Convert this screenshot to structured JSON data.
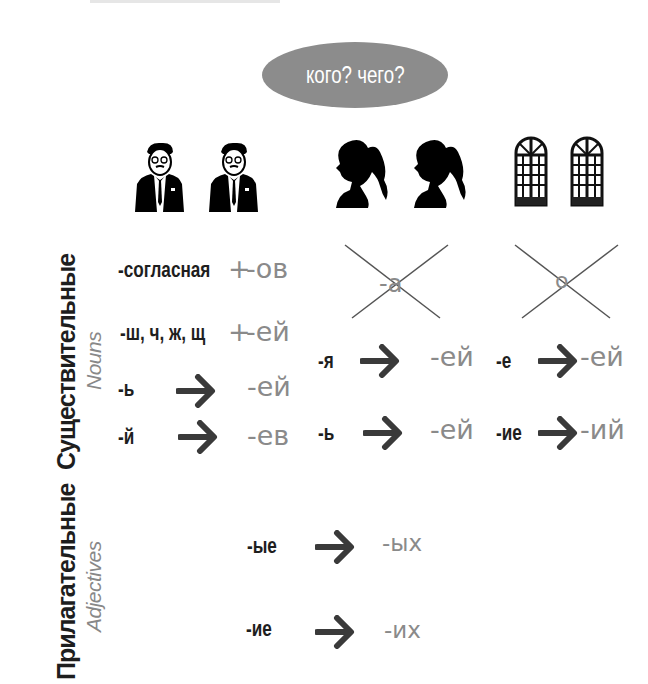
{
  "question_bubble": {
    "text": "кого? чего?",
    "color": "#8c8c8c"
  },
  "columns": [
    {
      "name": "masculine",
      "icon": "businessman-icon"
    },
    {
      "name": "feminine",
      "icon": "woman-silhouette-icon"
    },
    {
      "name": "neuter",
      "icon": "arched-window-icon"
    }
  ],
  "sections": {
    "nouns": {
      "label": "Существительные",
      "sublabel": "Nouns"
    },
    "adjectives": {
      "label": "Прилагательные",
      "sublabel": "Adjectives"
    }
  },
  "nouns": {
    "masculine": [
      {
        "from": "-согласная",
        "op": "+",
        "to": "-ов"
      },
      {
        "from": "-ш, ч, ж, щ",
        "op": "+",
        "to": "-ей"
      },
      {
        "from": "-ь",
        "op": "arrow",
        "to": "-ей"
      },
      {
        "from": "-й",
        "op": "arrow",
        "to": "-ев"
      }
    ],
    "feminine": {
      "crossed_out": "-а",
      "rules": [
        {
          "from": "-я",
          "op": "arrow",
          "to": "-ей"
        },
        {
          "from": "-ь",
          "op": "arrow",
          "to": "-ей"
        }
      ]
    },
    "neuter": {
      "crossed_out": "о",
      "rules": [
        {
          "from": "-е",
          "op": "arrow",
          "to": "-ей"
        },
        {
          "from": "-ие",
          "op": "arrow",
          "to": "-ий"
        }
      ]
    }
  },
  "adjectives": [
    {
      "from": "-ые",
      "op": "arrow",
      "to": "-ых"
    },
    {
      "from": "-ие",
      "op": "arrow",
      "to": "-их"
    }
  ],
  "colors": {
    "dark_text": "#1e1e1e",
    "ending_text": "#8a8a8a",
    "arrow": "#3a3a3a"
  }
}
